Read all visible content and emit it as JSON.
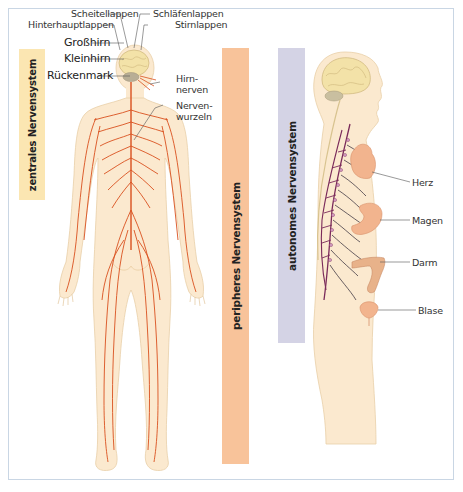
{
  "figure": {
    "colors": {
      "frame_border": "#c9d6e4",
      "central_bar": "#fbe6b2",
      "peripheral_bar": "#f8c39a",
      "autonomic_bar": "#d4d3e5",
      "skin": "#fbe9cf",
      "skin_outline": "#e8cfa8",
      "nerve": "#d9501e",
      "autonomic_nerve": "#7a2a5a",
      "brain": "#f3e2a8",
      "cerebellum": "#c9bfa0",
      "organ": "#f2b48e"
    },
    "sections": [
      {
        "id": "central",
        "label": "zentrales Nervensystem"
      },
      {
        "id": "peripheral",
        "label": "peripheres Nervensystem"
      },
      {
        "id": "autonomic",
        "label": "autonomes Nervensystem"
      }
    ],
    "front_figure_labels": {
      "scheitellappen": "Scheitellappen",
      "hinterhauptlappen": "Hinterhauptlappen",
      "schlaefenlappen": "Schläfenlappen",
      "stirnlappen": "Stirnlappen",
      "grosshirn": "Großhirn",
      "kleinhirn": "Kleinhirn",
      "rueckenmark": "Rückenmark",
      "hirnnerven_1": "Hirn-",
      "hirnnerven_2": "nerven",
      "nervenwurzeln_1": "Nerven-",
      "nervenwurzeln_2": "wurzeln"
    },
    "side_figure_labels": {
      "herz": "Herz",
      "magen": "Magen",
      "darm": "Darm",
      "blase": "Blase"
    }
  }
}
